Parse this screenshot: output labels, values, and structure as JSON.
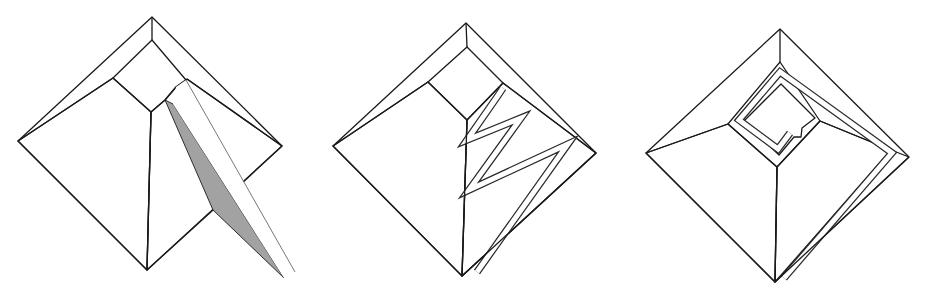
{
  "figure": {
    "colors": {
      "background": "#ffffff",
      "rim": "#b3b3b3",
      "left_face": "#a9a9a9",
      "right_face": "#c9c9c9",
      "ramp_shadow": "#a2a2a2",
      "ramp_path": "#ffffff",
      "edge": "#1a1a1a"
    },
    "panels": [
      {
        "id": "straight-ramp",
        "label": "Straight external ramp"
      },
      {
        "id": "zigzag-ramp",
        "label": "Zig-zag ramp on one face"
      },
      {
        "id": "spiral-ramp",
        "label": "Spiral ramp around the pyramid"
      }
    ]
  }
}
